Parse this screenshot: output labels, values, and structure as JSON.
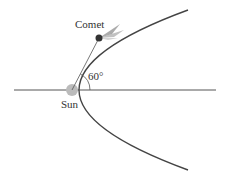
{
  "diagram": {
    "labels": {
      "comet": "Comet",
      "angle": "60°",
      "sun": "Sun"
    },
    "colors": {
      "curve": "#444444",
      "axis": "#555555",
      "sun": "#bbbbbb",
      "comet": "#333333",
      "text": "#333333"
    }
  }
}
